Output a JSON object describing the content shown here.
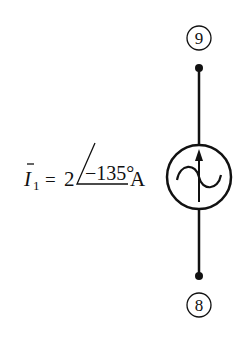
{
  "diagram": {
    "type": "circuit-element",
    "element": "ac-current-source",
    "top_node": {
      "label": "9"
    },
    "bottom_node": {
      "label": "8"
    },
    "source_label": {
      "symbol": "I",
      "subscript": "1",
      "equals": "=",
      "magnitude": "2",
      "angle": "−135°",
      "unit": "A"
    },
    "colors": {
      "stroke": "#111111",
      "background": "#ffffff"
    }
  }
}
